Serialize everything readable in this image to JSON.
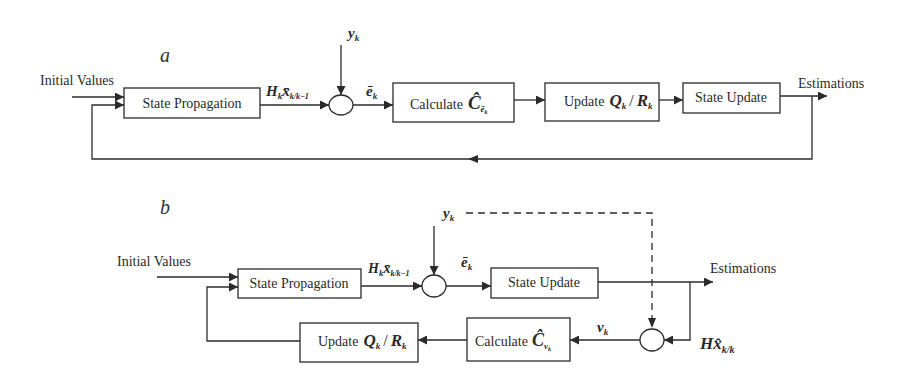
{
  "diagram_a": {
    "panel_label": "a",
    "input_label": "Initial Values",
    "output_label": "Estimations",
    "measurement_label": "y",
    "measurement_sub": "k",
    "predicted_meas_label": "H",
    "predicted_meas_sub1": "k",
    "predicted_meas_x": "x̄",
    "predicted_meas_sub2": "k/k−1",
    "innovation_label": "ē",
    "innovation_sub": "k",
    "boxes": {
      "state_propagation": "State Propagation",
      "calculate_prefix": "Calculate",
      "calculate_symbol": "Ĉ",
      "calculate_sub": "ē",
      "calculate_sub_k": "k",
      "update_prefix": "Update",
      "update_q": "Q",
      "update_sep": "/",
      "update_r": "R",
      "update_sub": "k",
      "state_update": "State Update"
    }
  },
  "diagram_b": {
    "panel_label": "b",
    "input_label": "Initial Values",
    "output_label": "Estimations",
    "measurement_label": "y",
    "measurement_sub": "k",
    "predicted_meas_label": "H",
    "predicted_meas_sub1": "k",
    "predicted_meas_x": "x̄",
    "predicted_meas_sub2": "k/k−1",
    "innovation_label": "ē",
    "innovation_sub": "k",
    "residual_label": "ν",
    "residual_sub": "k",
    "estimated_meas_label": "Hx̂",
    "estimated_meas_sub": "k/k",
    "boxes": {
      "state_propagation": "State Propagation",
      "state_update": "State Update",
      "calculate_prefix": "Calculate",
      "calculate_symbol": "Ĉ",
      "calculate_sub": "ν",
      "calculate_sub_k": "k",
      "update_prefix": "Update",
      "update_q": "Q",
      "update_sep": "/",
      "update_r": "R",
      "update_sub": "k"
    }
  },
  "colors": {
    "line": "#2b2b2b",
    "background": "#ffffff"
  }
}
